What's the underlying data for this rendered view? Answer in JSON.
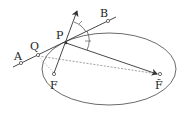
{
  "diagram": {
    "labels": {
      "A": "A",
      "B": "B",
      "P": "P",
      "Q": "Q",
      "F": "F",
      "F_tilde": "F̃"
    },
    "colors": {
      "stroke": "#333333",
      "dashed": "#777777",
      "background": "#ffffff"
    }
  }
}
